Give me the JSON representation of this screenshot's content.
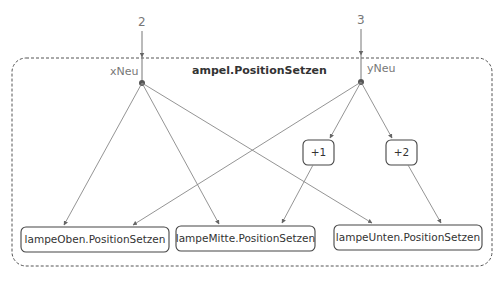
{
  "diagram": {
    "title": "ampel.PositionSetzen",
    "inputs": [
      {
        "value": "2",
        "param": "xNeu"
      },
      {
        "value": "3",
        "param": "yNeu"
      }
    ],
    "operators": [
      {
        "label": "+1"
      },
      {
        "label": "+2"
      }
    ],
    "targets": [
      {
        "label": "lampeOben.PositionSetzen"
      },
      {
        "label": "lampeMitte.PositionSetzen"
      },
      {
        "label": "lampeUnten.PositionSetzen"
      }
    ],
    "edges": [
      {
        "from": "xNeu",
        "to": "lampeOben.PositionSetzen"
      },
      {
        "from": "xNeu",
        "to": "lampeMitte.PositionSetzen"
      },
      {
        "from": "xNeu",
        "to": "lampeUnten.PositionSetzen"
      },
      {
        "from": "yNeu",
        "to": "lampeOben.PositionSetzen"
      },
      {
        "from": "yNeu",
        "to": "+1"
      },
      {
        "from": "yNeu",
        "to": "+2"
      },
      {
        "from": "+1",
        "to": "lampeMitte.PositionSetzen"
      },
      {
        "from": "+2",
        "to": "lampeUnten.PositionSetzen"
      }
    ]
  }
}
